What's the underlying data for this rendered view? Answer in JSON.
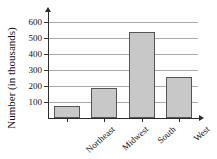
{
  "chart_data": {
    "type": "bar",
    "title": "",
    "title_remnant": "",
    "xlabel": "",
    "ylabel": "Number (in thousands)",
    "categories": [
      "Northeast",
      "Midwest",
      "South",
      "West"
    ],
    "values": [
      75,
      190,
      540,
      255
    ],
    "ylim": [
      0,
      650
    ],
    "yticks": [
      100,
      200,
      300,
      400,
      500,
      600
    ],
    "ytick_labels": [
      "100",
      "200",
      "300",
      "400",
      "500",
      "600"
    ],
    "grid": true,
    "grid_axis": "y",
    "legend": null,
    "bar_color": "#c8c8c8",
    "bar_edge_color": "#555555",
    "axis_color": "#2b2b2b",
    "gridline_color": "#a9a9a9"
  }
}
